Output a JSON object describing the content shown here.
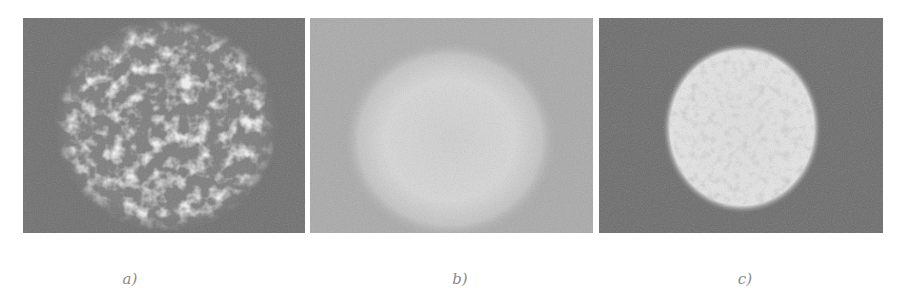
{
  "figure": {
    "panels": [
      {
        "id": "a",
        "caption": "a)",
        "description": "Textured, fragmented bright speckle pattern within a circular region on a dark gray background",
        "background_color": "#6e6e6e",
        "spot_color": "#f2f2f2"
      },
      {
        "id": "b",
        "caption": "b)",
        "description": "Diffuse, low-contrast bright circular spot on a light gray background",
        "background_color": "#a9a9a9",
        "spot_color": "#d6d6d6"
      },
      {
        "id": "c",
        "caption": "c)",
        "description": "Sharp-edged bright circular disk with fine speckle on a dark gray background",
        "background_color": "#6a6a6a",
        "spot_color": "#e4e4e4"
      }
    ]
  }
}
